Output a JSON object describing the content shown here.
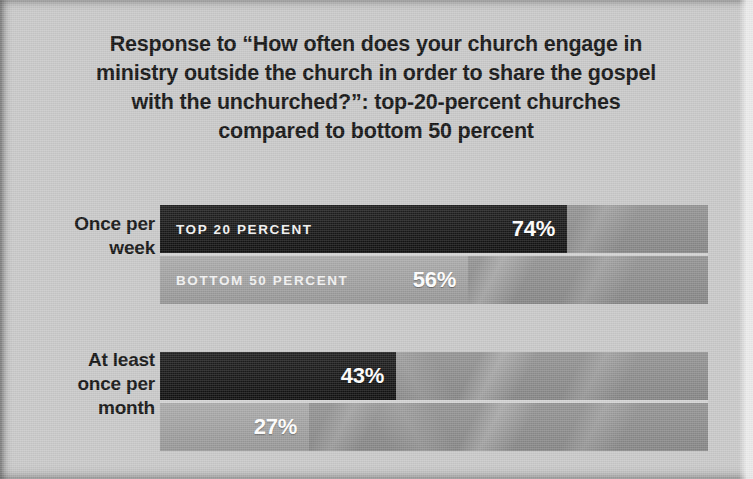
{
  "title": {
    "lines": [
      "Response to “How often does your church engage in",
      "ministry outside the church in order to share the gospel",
      "with the unchurched?”: top-20-percent churches",
      "compared to bottom 50 percent"
    ]
  },
  "colors": {
    "background": "#c9c9c9",
    "track": "#8e8e8e",
    "top_20_bar": "#161616",
    "bottom_50_bar": "#a3a3a3",
    "title_text": "#131313",
    "value_text": "#ffffff"
  },
  "legend": {
    "top_series_label": "TOP 20 PERCENT",
    "bottom_series_label": "BOTTOM 50 PERCENT"
  },
  "groups": [
    {
      "category_lines": [
        "Once per",
        "week"
      ],
      "top": {
        "label": "TOP 20 PERCENT",
        "value": 74,
        "value_text": "74%"
      },
      "bottom": {
        "label": "BOTTOM 50 PERCENT",
        "value": 56,
        "value_text": "56%"
      }
    },
    {
      "category_lines": [
        "At least",
        "once per",
        "month"
      ],
      "top": {
        "label": "",
        "value": 43,
        "value_text": "43%"
      },
      "bottom": {
        "label": "",
        "value": 27,
        "value_text": "27%"
      }
    }
  ],
  "chart_data": {
    "type": "bar",
    "orientation": "horizontal",
    "title": "Response to “How often does your church engage in ministry outside the church in order to share the gospel with the unchurched?”: top-20-percent churches compared to bottom 50 percent",
    "subtitle": "",
    "xlabel": "",
    "ylabel": "",
    "categories": [
      "Once per week",
      "At least once per month"
    ],
    "series": [
      {
        "name": "TOP 20 PERCENT",
        "values": [
          74,
          43
        ],
        "color": "#161616"
      },
      {
        "name": "BOTTOM 50 PERCENT",
        "values": [
          56,
          27
        ],
        "color": "#a3a3a3"
      }
    ],
    "value_labels": [
      [
        "74%",
        "43%"
      ],
      [
        "56%",
        "27%"
      ]
    ],
    "xlim": [
      0,
      100
    ],
    "unit": "percent",
    "grid": false,
    "legend_position": "inline-in-bars",
    "axis_ticks": []
  }
}
